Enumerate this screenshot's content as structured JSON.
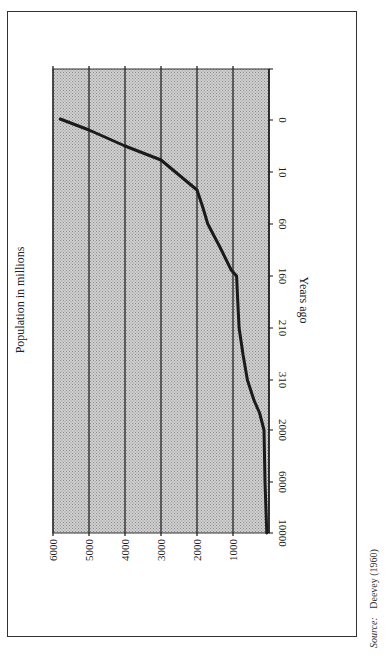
{
  "chart_data": {
    "type": "line",
    "orientation": "rotated 90deg clockwise on page",
    "title": "",
    "xlabel": "Years ago",
    "ylabel": "Population in millions",
    "categories": [
      "",
      "0",
      "10",
      "60",
      "160",
      "210",
      "310",
      "2000",
      "6000",
      "10000"
    ],
    "x_ticks": [
      "0",
      "10",
      "60",
      "160",
      "210",
      "310",
      "2000",
      "6000",
      "10000"
    ],
    "y_ticks": [
      "1000",
      "2000",
      "3000",
      "4000",
      "5000",
      "6000"
    ],
    "ylim": [
      0,
      6000
    ],
    "grid": true,
    "series": [
      {
        "name": "World population",
        "x": [
          "0",
          "10",
          "60",
          "160",
          "210",
          "310",
          "2000",
          "6000",
          "10000"
        ],
        "values": [
          5800,
          2600,
          1700,
          900,
          830,
          600,
          140,
          110,
          60
        ]
      }
    ],
    "legend": null,
    "source": {
      "label": "Source:",
      "text": "Deevey (1960)"
    }
  },
  "labels": {
    "xlabel": "Years ago",
    "ylabel": "Population in millions",
    "source_label": "Source:",
    "source_text": "Deevey (1960)"
  },
  "colors": {
    "plot_fill": "#c4c4c4",
    "line": "#1a1a1a",
    "grid": "#222222"
  }
}
